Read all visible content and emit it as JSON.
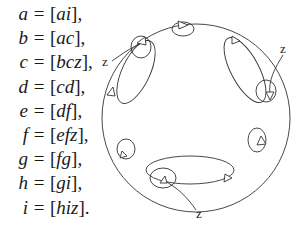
{
  "equations": [
    {
      "lhs": "a",
      "rhs_open": "[",
      "rhs_body": "ai",
      "rhs_close": "],"
    },
    {
      "lhs": "b",
      "rhs_open": "[",
      "rhs_body": "ac",
      "rhs_close": "],"
    },
    {
      "lhs": "c",
      "rhs_open": "[",
      "rhs_body": "bcz",
      "rhs_close": "],"
    },
    {
      "lhs": "d",
      "rhs_open": "[",
      "rhs_body": "cd",
      "rhs_close": "],"
    },
    {
      "lhs": "e",
      "rhs_open": "[",
      "rhs_body": "df",
      "rhs_close": "],"
    },
    {
      "lhs": "f",
      "rhs_open": "[",
      "rhs_body": "efz",
      "rhs_close": "],"
    },
    {
      "lhs": "g",
      "rhs_open": "[",
      "rhs_body": "fg",
      "rhs_close": "],"
    },
    {
      "lhs": "h",
      "rhs_open": "[",
      "rhs_body": "gi",
      "rhs_close": "],"
    },
    {
      "lhs": "i",
      "rhs_open": "[",
      "rhs_body": "hiz",
      "rhs_close": "]."
    }
  ],
  "operator": "=",
  "diagram": {
    "labels": {
      "z_left": "z",
      "z_right": "z",
      "z_bottom": "z"
    },
    "stroke_color": "#333333"
  }
}
